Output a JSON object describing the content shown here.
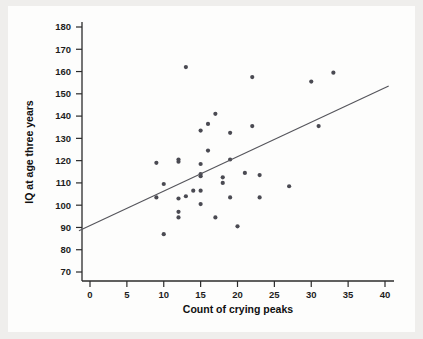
{
  "figure": {
    "background_color": "#efeeec",
    "panel_color": "#fdfdfc",
    "point_color": "#4a4a52",
    "line_color": "#55555b",
    "axis_color": "#2b2b2b"
  },
  "chart_data": {
    "type": "scatter",
    "title": "",
    "subtitle": "",
    "xlabel": "Count of crying peaks",
    "ylabel": "IQ at age three years",
    "xlim": [
      -1.5,
      42
    ],
    "ylim": [
      66,
      184
    ],
    "xticks": [
      0,
      5,
      10,
      15,
      20,
      25,
      30,
      35,
      40
    ],
    "xtick_labels": [
      "0",
      "5",
      "10",
      "15",
      "20",
      "25",
      "30",
      "35",
      "40"
    ],
    "yticks": [
      70,
      80,
      90,
      100,
      110,
      120,
      130,
      140,
      150,
      160,
      170,
      180
    ],
    "ytick_labels": [
      "70",
      "80",
      "90",
      "100",
      "110",
      "120",
      "130",
      "140",
      "150",
      "160",
      "170",
      "180"
    ],
    "grid": false,
    "legend": null,
    "series": [
      {
        "name": "Infants",
        "marker": "circle",
        "points": [
          [
            9,
            119
          ],
          [
            9,
            103.5
          ],
          [
            10,
            109.5
          ],
          [
            10,
            87
          ],
          [
            12,
            119.5
          ],
          [
            12,
            120.5
          ],
          [
            12,
            103
          ],
          [
            12,
            97
          ],
          [
            12,
            94.5
          ],
          [
            13,
            162
          ],
          [
            13,
            104
          ],
          [
            14,
            106.5
          ],
          [
            15,
            133.5
          ],
          [
            15,
            113
          ],
          [
            15,
            114
          ],
          [
            15,
            118.5
          ],
          [
            15,
            106.5
          ],
          [
            15,
            100.5
          ],
          [
            16,
            136.5
          ],
          [
            16,
            124.5
          ],
          [
            17,
            141
          ],
          [
            17,
            94.5
          ],
          [
            18,
            112.5
          ],
          [
            18,
            110
          ],
          [
            19,
            120.5
          ],
          [
            19,
            132.5
          ],
          [
            19,
            103.5
          ],
          [
            20,
            90.5
          ],
          [
            21,
            114.5
          ],
          [
            22,
            157.5
          ],
          [
            22,
            135.5
          ],
          [
            23,
            113.5
          ],
          [
            23,
            103.5
          ],
          [
            27,
            108.5
          ],
          [
            30,
            155.5
          ],
          [
            31,
            135.5
          ],
          [
            33,
            159.5
          ]
        ]
      }
    ],
    "trend_line": {
      "type": "linear-fit",
      "x_start": -1.5,
      "y_start": 88.5,
      "x_end": 40.5,
      "y_end": 153.5
    }
  }
}
